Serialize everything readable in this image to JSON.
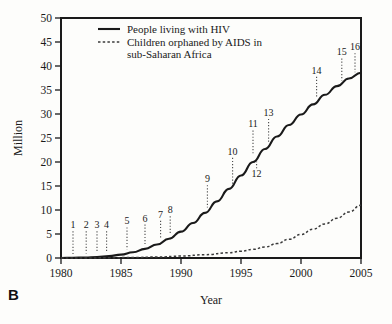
{
  "panel": {
    "label": "B"
  },
  "chart_data": {
    "type": "line",
    "title": "",
    "xlabel": "Year",
    "ylabel": "Million",
    "xlim": [
      1980,
      2005
    ],
    "ylim": [
      0,
      50
    ],
    "grid": false,
    "legend_position": "top-left inside",
    "xticks": [
      1980,
      1985,
      1990,
      1995,
      2000,
      2005
    ],
    "yticks": [
      0,
      5,
      10,
      15,
      20,
      25,
      30,
      35,
      40,
      45,
      50
    ],
    "series": [
      {
        "name": "People living with HIV",
        "style": "solid",
        "color": "#1a1a1a",
        "x": [
          1980,
          1981,
          1982,
          1983,
          1984,
          1985,
          1986,
          1987,
          1988,
          1989,
          1990,
          1991,
          1992,
          1993,
          1994,
          1995,
          1996,
          1997,
          1998,
          1999,
          2000,
          2001,
          2002,
          2003,
          2004,
          2005
        ],
        "values": [
          0.0,
          0.05,
          0.1,
          0.2,
          0.4,
          0.7,
          1.2,
          1.9,
          2.8,
          4.0,
          5.5,
          7.3,
          9.4,
          11.8,
          14.4,
          17.2,
          20.0,
          22.7,
          25.3,
          27.7,
          29.9,
          32.0,
          34.0,
          35.8,
          37.4,
          38.6
        ]
      },
      {
        "name": "Children orphaned by AIDS in sub-Saharan Africa",
        "style": "dashed",
        "color": "#3a3a3a",
        "x": [
          1980,
          1982,
          1984,
          1986,
          1988,
          1990,
          1992,
          1994,
          1995,
          1996,
          1997,
          1998,
          1999,
          2000,
          2001,
          2002,
          2003,
          2004,
          2005
        ],
        "values": [
          0.0,
          0.0,
          0.05,
          0.1,
          0.2,
          0.4,
          0.7,
          1.1,
          1.4,
          1.8,
          2.3,
          3.0,
          3.9,
          4.9,
          6.0,
          7.1,
          8.3,
          9.6,
          11.0
        ]
      }
    ],
    "annotations": [
      {
        "label": "1",
        "x": 1981.0,
        "y": 6.2,
        "anchor_y": 0.4
      },
      {
        "label": "2",
        "x": 1982.1,
        "y": 6.2,
        "anchor_y": 0.5
      },
      {
        "label": "3",
        "x": 1983.0,
        "y": 6.2,
        "anchor_y": 0.6
      },
      {
        "label": "4",
        "x": 1983.8,
        "y": 6.2,
        "anchor_y": 0.9
      },
      {
        "label": "5",
        "x": 1985.5,
        "y": 7.0,
        "anchor_y": 1.4
      },
      {
        "label": "6",
        "x": 1987.0,
        "y": 7.6,
        "anchor_y": 2.5
      },
      {
        "label": "7",
        "x": 1988.3,
        "y": 8.4,
        "anchor_y": 3.8
      },
      {
        "label": "8",
        "x": 1989.1,
        "y": 9.3,
        "anchor_y": 4.6
      },
      {
        "label": "9",
        "x": 1992.2,
        "y": 15.8,
        "anchor_y": 10.1
      },
      {
        "label": "10",
        "x": 1994.3,
        "y": 21.5,
        "anchor_y": 15.0
      },
      {
        "label": "11",
        "x": 1996.0,
        "y": 27.2,
        "anchor_y": 21.0
      },
      {
        "label": "12",
        "x": 1996.3,
        "y": 16.8,
        "anchor_y": 20.5
      },
      {
        "label": "13",
        "x": 1997.3,
        "y": 29.6,
        "anchor_y": 23.8
      },
      {
        "label": "14",
        "x": 2001.3,
        "y": 38.4,
        "anchor_y": 32.8
      },
      {
        "label": "15",
        "x": 2003.4,
        "y": 42.2,
        "anchor_y": 36.5
      },
      {
        "label": "16",
        "x": 2004.5,
        "y": 43.3,
        "anchor_y": 38.3
      }
    ]
  }
}
